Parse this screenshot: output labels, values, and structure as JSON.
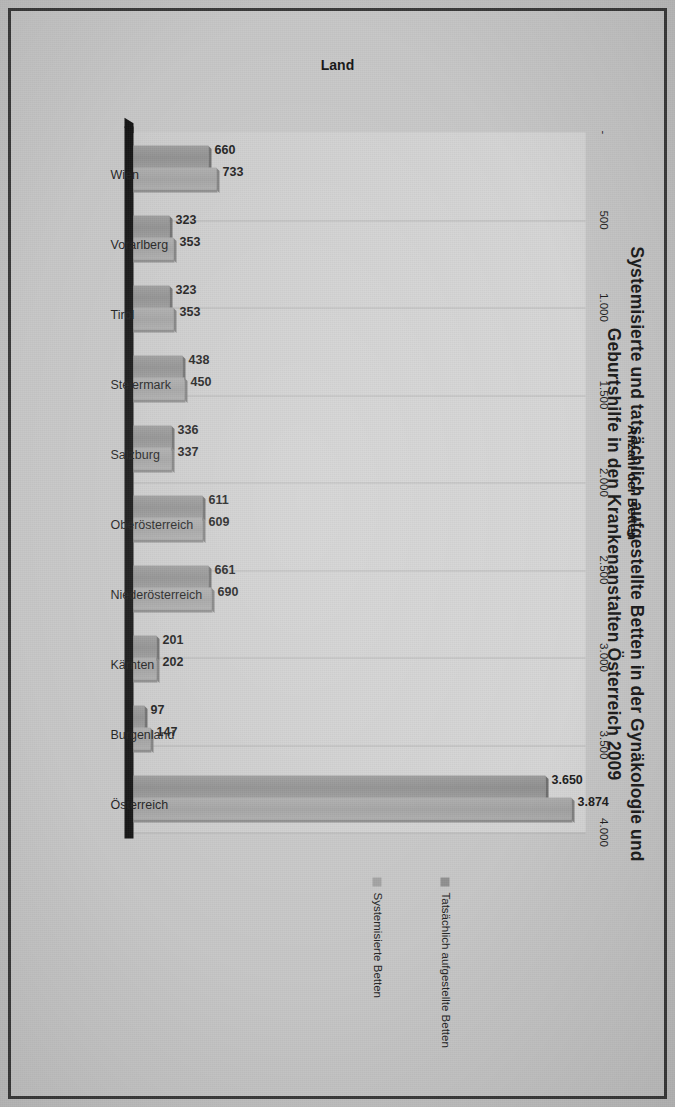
{
  "chart_data": {
    "type": "bar",
    "orientation": "vertical-printed-rotated",
    "title": "Systemisierte und tatsächlich aufgestellte Betten in der Gynäkologie und Geburtshilfe in den Krankenanstalten Österreich 2009",
    "title_line1": "Systemisierte und tatsächlich aufgestellte Betten in der Gynäkologie und",
    "title_line2": "Geburtshilfe in den Krankenanstalten Österreich 2009",
    "xlabel": "Land",
    "ylabel": "Anzahl der Betten",
    "categories": [
      "Wien",
      "Vorarlberg",
      "Tirol",
      "Steiermark",
      "Salzburg",
      "Oberösterreich",
      "Niederösterreich",
      "Kärnten",
      "Burgenland",
      "Österreich"
    ],
    "series": [
      {
        "name": "Tatsächlich aufgestellte Betten",
        "color": "#8f8f8f",
        "values": [
          660,
          323,
          323,
          438,
          336,
          611,
          661,
          201,
          97,
          3650
        ],
        "labels": [
          "660",
          "323",
          "323",
          "438",
          "336",
          "611",
          "661",
          "201",
          "97",
          "3.650"
        ]
      },
      {
        "name": "Systemisierte Betten",
        "color": "#a2a2a2",
        "values": [
          733,
          353,
          353,
          450,
          337,
          609,
          690,
          202,
          147,
          3874
        ],
        "labels": [
          "733",
          "353",
          "353",
          "450",
          "337",
          "609",
          "690",
          "202",
          "147",
          "3.874"
        ]
      }
    ],
    "ylim": [
      0,
      4000
    ],
    "tick_labels": [
      "-",
      "500",
      "1.000",
      "1.500",
      "2.000",
      "2.500",
      "3.000",
      "3.500",
      "4.000"
    ],
    "tick_values": [
      0,
      500,
      1000,
      1500,
      2000,
      2500,
      3000,
      3500,
      4000
    ],
    "grid": true,
    "legend_position": "right"
  }
}
